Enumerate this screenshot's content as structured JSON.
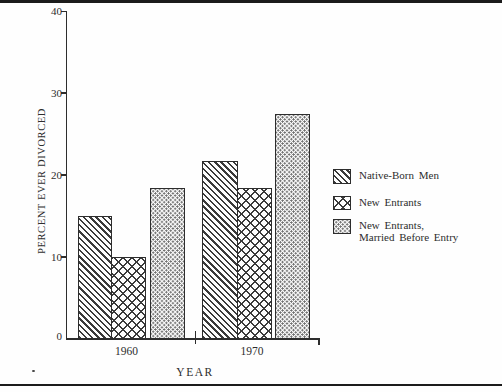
{
  "figure": {
    "paper_color": "#fefefe",
    "ink_color": "#2d2d2d",
    "top_rule": true,
    "bottom_rule": true
  },
  "chart_data": {
    "type": "bar",
    "title": "",
    "xlabel": "YEAR",
    "ylabel": "PERCENT EVER DIVORCED",
    "categories": [
      "1960",
      "1970"
    ],
    "series": [
      {
        "name": "Native-Born Men",
        "legend_label": "Native-Born Men",
        "pattern": "diagonal-hatch",
        "values": [
          15.0,
          21.7
        ]
      },
      {
        "name": "New Entrants",
        "legend_label": "New Entrants",
        "pattern": "crosshatch",
        "values": [
          10.0,
          18.4
        ]
      },
      {
        "name": "New Entrants, Married Before Entry",
        "legend_label": "New Entrants,\nMarried Before Entry",
        "pattern": "dotted",
        "values": [
          18.4,
          27.5
        ]
      }
    ],
    "ylim": [
      0,
      40
    ],
    "yticks": [
      0,
      10,
      20,
      30,
      40
    ],
    "grid": false,
    "legend_position": "right"
  }
}
